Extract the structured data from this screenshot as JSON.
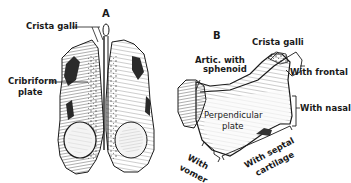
{
  "figure": {
    "panels": [
      {
        "id": "A",
        "letter": "A",
        "view": "superior view",
        "labels": {
          "crista_galli": "Crista galli",
          "cribriform_1": "Cribriform",
          "cribriform_2": "plate"
        }
      },
      {
        "id": "B",
        "letter": "B",
        "view": "lateral view of perpendicular plate",
        "labels": {
          "artic_1": "Artic. with",
          "artic_2": "sphenoid",
          "crista_galli": "Crista galli",
          "with_frontal": "With frontal",
          "with_nasal": "With nasal",
          "perp_1": "Perpendicular",
          "perp_2": "plate",
          "vomer_1": "With",
          "vomer_2": "vomer",
          "septal_1": "With septal",
          "septal_2": "cartilage"
        }
      }
    ],
    "colors": {
      "ink": "#1a1a1a",
      "shade": "#3a3a3a",
      "paper": "#ffffff"
    }
  }
}
